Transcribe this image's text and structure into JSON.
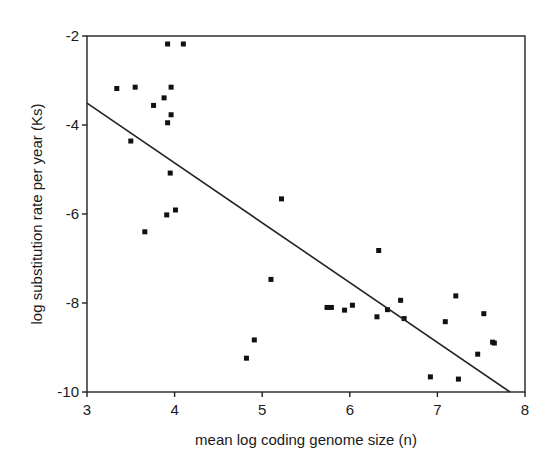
{
  "chart_data": {
    "type": "scatter",
    "title": "",
    "xlabel": "mean log coding genome size (n)",
    "ylabel": "log substitution rate per year (Ks)",
    "xlim": [
      3,
      8
    ],
    "ylim": [
      -10,
      -2
    ],
    "xticks": [
      3,
      4,
      5,
      6,
      7,
      8
    ],
    "yticks": [
      -2,
      -4,
      -6,
      -8,
      -10
    ],
    "grid": false,
    "legend": null,
    "series": [
      {
        "name": "data",
        "points": [
          [
            3.92,
            -2.18
          ],
          [
            4.1,
            -2.18
          ],
          [
            3.34,
            -3.18
          ],
          [
            3.55,
            -3.15
          ],
          [
            3.96,
            -3.15
          ],
          [
            3.88,
            -3.39
          ],
          [
            3.76,
            -3.56
          ],
          [
            3.96,
            -3.77
          ],
          [
            3.92,
            -3.95
          ],
          [
            3.5,
            -4.36
          ],
          [
            3.95,
            -5.08
          ],
          [
            5.22,
            -5.66
          ],
          [
            4.01,
            -5.91
          ],
          [
            3.91,
            -6.02
          ],
          [
            3.66,
            -6.4
          ],
          [
            5.1,
            -7.47
          ],
          [
            4.91,
            -8.83
          ],
          [
            4.82,
            -9.24
          ],
          [
            6.33,
            -6.82
          ],
          [
            5.74,
            -8.1
          ],
          [
            5.79,
            -8.1
          ],
          [
            5.94,
            -8.16
          ],
          [
            6.03,
            -8.05
          ],
          [
            6.31,
            -8.31
          ],
          [
            6.43,
            -8.15
          ],
          [
            6.58,
            -7.94
          ],
          [
            6.62,
            -8.35
          ],
          [
            7.09,
            -8.42
          ],
          [
            7.21,
            -7.84
          ],
          [
            7.53,
            -8.24
          ],
          [
            7.63,
            -8.88
          ],
          [
            7.65,
            -8.9
          ],
          [
            7.46,
            -9.15
          ],
          [
            6.92,
            -9.66
          ],
          [
            7.24,
            -9.71
          ]
        ]
      }
    ],
    "regression_line": {
      "x1": 3.0,
      "y1": -3.51,
      "x2": 7.83,
      "y2": -10.0
    }
  }
}
